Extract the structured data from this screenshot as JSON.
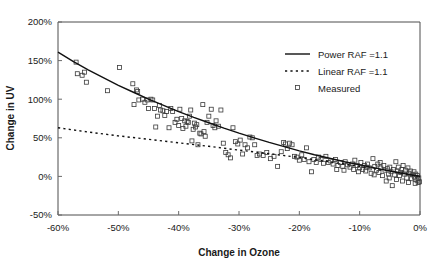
{
  "chart_data": {
    "type": "scatter",
    "title": "",
    "xlabel": "Change in Ozone",
    "ylabel": "Change in UV",
    "xlim": [
      -60,
      0
    ],
    "ylim": [
      -50,
      200
    ],
    "xticks": [
      "-60%",
      "-50%",
      "-40%",
      "-30%",
      "-20%",
      "-10%",
      "0%"
    ],
    "xtick_values": [
      -60,
      -50,
      -40,
      -30,
      -20,
      -10,
      0
    ],
    "yticks": [
      "-50%",
      "0%",
      "50%",
      "100%",
      "150%",
      "200%"
    ],
    "ytick_values": [
      -50,
      0,
      50,
      100,
      150,
      200
    ],
    "grid": false,
    "legend_position": "top-right",
    "legend": [
      {
        "label": "Power RAF =1.1",
        "marker": "solid-line"
      },
      {
        "label": "Linear RAF =1.1",
        "marker": "dashed-line"
      },
      {
        "label": "Measured",
        "marker": "open-square"
      }
    ],
    "series": [
      {
        "name": "Power RAF =1.1",
        "type": "line",
        "style": "solid",
        "x": [
          -60,
          -57.5,
          -55,
          -52.5,
          -50,
          -47.5,
          -45,
          -42.5,
          -40,
          -37.5,
          -35,
          -32.5,
          -30,
          -27.5,
          -25,
          -22.5,
          -20,
          -17.5,
          -15,
          -12.5,
          -10,
          -7.5,
          -5,
          -2.5,
          0
        ],
        "y": [
          161,
          149,
          138,
          128,
          118,
          109,
          100,
          92,
          84,
          76.5,
          69.5,
          62.5,
          56,
          50,
          44,
          38.5,
          33,
          28,
          23.5,
          19,
          15,
          11,
          7.2,
          3.5,
          0
        ]
      },
      {
        "name": "Linear RAF =1.1",
        "type": "line",
        "style": "dashed",
        "x": [
          -60,
          -55,
          -50,
          -45,
          -40,
          -35,
          -30,
          -25,
          -20,
          -15,
          -10,
          -5,
          0
        ],
        "y": [
          63,
          57.5,
          52.5,
          48,
          43.5,
          39,
          34,
          29.5,
          24.5,
          19,
          13,
          6.8,
          0
        ]
      },
      {
        "name": "Measured",
        "type": "scatter",
        "marker": "open-square",
        "points": [
          [
            -57.0,
            148
          ],
          [
            -56.8,
            133
          ],
          [
            -56.0,
            131
          ],
          [
            -55.6,
            135
          ],
          [
            -55.3,
            122
          ],
          [
            -51.8,
            111
          ],
          [
            -49.8,
            141
          ],
          [
            -47.6,
            120
          ],
          [
            -47.4,
            93
          ],
          [
            -47.0,
            112
          ],
          [
            -46.8,
            110
          ],
          [
            -46.6,
            99
          ],
          [
            -46.0,
            100
          ],
          [
            -45.6,
            96
          ],
          [
            -45.2,
            99
          ],
          [
            -45.0,
            88
          ],
          [
            -44.6,
            100
          ],
          [
            -44.3,
            99
          ],
          [
            -44.0,
            88
          ],
          [
            -43.8,
            64
          ],
          [
            -43.5,
            78
          ],
          [
            -43.2,
            92
          ],
          [
            -43.0,
            86
          ],
          [
            -42.6,
            85
          ],
          [
            -42.3,
            79
          ],
          [
            -42.0,
            84
          ],
          [
            -41.6,
            63
          ],
          [
            -41.3,
            88
          ],
          [
            -41.0,
            84
          ],
          [
            -40.6,
            70
          ],
          [
            -40.3,
            74
          ],
          [
            -40.0,
            66
          ],
          [
            -39.8,
            87
          ],
          [
            -39.5,
            75
          ],
          [
            -39.3,
            62
          ],
          [
            -39.0,
            72
          ],
          [
            -38.8,
            65
          ],
          [
            -38.6,
            71
          ],
          [
            -38.4,
            70
          ],
          [
            -38.2,
            78
          ],
          [
            -38.0,
            86
          ],
          [
            -37.8,
            46
          ],
          [
            -37.6,
            61
          ],
          [
            -37.4,
            69
          ],
          [
            -37.2,
            64
          ],
          [
            -37.0,
            67
          ],
          [
            -36.8,
            41
          ],
          [
            -36.5,
            56
          ],
          [
            -36.3,
            55
          ],
          [
            -36.0,
            93
          ],
          [
            -35.8,
            58
          ],
          [
            -35.6,
            52
          ],
          [
            -35.3,
            70
          ],
          [
            -35.0,
            78
          ],
          [
            -34.6,
            87
          ],
          [
            -34.3,
            66
          ],
          [
            -34.0,
            63
          ],
          [
            -33.8,
            72
          ],
          [
            -33.4,
            65
          ],
          [
            -33.0,
            86
          ],
          [
            -32.6,
            43
          ],
          [
            -32.2,
            31
          ],
          [
            -31.8,
            28
          ],
          [
            -31.4,
            24
          ],
          [
            -31.0,
            63
          ],
          [
            -30.6,
            45
          ],
          [
            -30.2,
            42
          ],
          [
            -29.8,
            47
          ],
          [
            -29.4,
            29
          ],
          [
            -29.0,
            41
          ],
          [
            -28.6,
            37
          ],
          [
            -28.2,
            51
          ],
          [
            -27.8,
            50
          ],
          [
            -27.4,
            41
          ],
          [
            -27.0,
            27
          ],
          [
            -26.6,
            29
          ],
          [
            -26.0,
            27
          ],
          [
            -25.4,
            31
          ],
          [
            -24.8,
            23
          ],
          [
            -24.2,
            26
          ],
          [
            -23.6,
            13
          ],
          [
            -23.0,
            32
          ],
          [
            -22.6,
            44
          ],
          [
            -22.3,
            42
          ],
          [
            -22.0,
            36
          ],
          [
            -21.6,
            43
          ],
          [
            -21.2,
            41
          ],
          [
            -20.8,
            26
          ],
          [
            -20.4,
            25
          ],
          [
            -20.0,
            21
          ],
          [
            -19.6,
            28
          ],
          [
            -19.2,
            22
          ],
          [
            -18.8,
            37
          ],
          [
            -18.4,
            19
          ],
          [
            -18.0,
            6
          ],
          [
            -17.6,
            22
          ],
          [
            -17.2,
            18
          ],
          [
            -16.8,
            25
          ],
          [
            -16.4,
            22
          ],
          [
            -16.0,
            17
          ],
          [
            -15.6,
            26
          ],
          [
            -15.2,
            18
          ],
          [
            -14.8,
            20
          ],
          [
            -14.4,
            16
          ],
          [
            -14.0,
            22
          ],
          [
            -13.6,
            14
          ],
          [
            -13.2,
            18
          ],
          [
            -12.8,
            13
          ],
          [
            -12.4,
            19
          ],
          [
            -12.0,
            15
          ],
          [
            -11.6,
            12
          ],
          [
            -11.2,
            16
          ],
          [
            -10.8,
            21
          ],
          [
            -10.4,
            14
          ],
          [
            -10.0,
            11
          ],
          [
            -9.8,
            18
          ],
          [
            -9.5,
            9
          ],
          [
            -9.2,
            14
          ],
          [
            -9.0,
            7
          ],
          [
            -8.7,
            16
          ],
          [
            -8.4,
            11
          ],
          [
            -8.1,
            4
          ],
          [
            -7.8,
            23
          ],
          [
            -7.5,
            13
          ],
          [
            -7.2,
            8
          ],
          [
            -7.0,
            16
          ],
          [
            -6.8,
            5
          ],
          [
            -6.5,
            11
          ],
          [
            -6.2,
            1
          ],
          [
            -6.0,
            14
          ],
          [
            -5.8,
            8
          ],
          [
            -5.6,
            -6
          ],
          [
            -5.4,
            10
          ],
          [
            -5.2,
            3
          ],
          [
            -5.0,
            12
          ],
          [
            -4.8,
            6
          ],
          [
            -4.6,
            -12
          ],
          [
            -4.4,
            9
          ],
          [
            -4.2,
            2
          ],
          [
            -4.0,
            19
          ],
          [
            -3.8,
            7
          ],
          [
            -3.6,
            12
          ],
          [
            -3.4,
            1
          ],
          [
            -3.2,
            5
          ],
          [
            -3.0,
            9
          ],
          [
            -2.8,
            14
          ],
          [
            -2.6,
            3
          ],
          [
            -2.4,
            8
          ],
          [
            -2.2,
            -2
          ],
          [
            -2.0,
            11
          ],
          [
            -1.8,
            4
          ],
          [
            -1.6,
            7
          ],
          [
            -1.4,
            -3
          ],
          [
            -1.2,
            2
          ],
          [
            -1.0,
            6
          ],
          [
            -0.9,
            -1
          ],
          [
            -0.7,
            3
          ],
          [
            -0.5,
            -5
          ],
          [
            -0.4,
            1
          ],
          [
            -0.3,
            -8
          ],
          [
            -0.2,
            -2
          ],
          [
            -0.1,
            -7
          ],
          [
            -13.8,
            9
          ],
          [
            -12.6,
            8
          ],
          [
            -11.0,
            9
          ],
          [
            -10.2,
            6
          ],
          [
            -8.9,
            12
          ],
          [
            -7.6,
            2
          ],
          [
            -6.6,
            18
          ],
          [
            -5.1,
            -2
          ],
          [
            -3.9,
            -4
          ],
          [
            -2.9,
            -6
          ],
          [
            -1.9,
            -8
          ],
          [
            -0.8,
            -9
          ]
        ]
      }
    ]
  },
  "layout": {
    "plot_left": 58,
    "plot_right": 420,
    "plot_top": 22,
    "plot_bottom": 215
  }
}
